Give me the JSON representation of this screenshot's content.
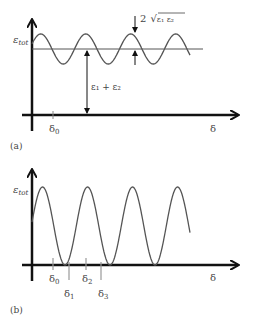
{
  "panels": [
    {
      "id": "a",
      "label": "(a)",
      "y_axis_label": "ε",
      "y_axis_sub": "tot",
      "x_axis_label": "δ",
      "tick_labels": [
        {
          "text": "δ",
          "sub": "0"
        }
      ],
      "annotation_amplitude": {
        "prefix": "2",
        "radicand": "ε₁ ε₂"
      },
      "annotation_mean": "ε₁ + ε₂"
    },
    {
      "id": "b",
      "label": "(b)",
      "y_axis_label": "ε",
      "y_axis_sub": "tot",
      "x_axis_label": "δ",
      "tick_labels": [
        {
          "text": "δ",
          "sub": "0"
        },
        {
          "text": "δ",
          "sub": "1"
        },
        {
          "text": "δ",
          "sub": "2"
        },
        {
          "text": "δ",
          "sub": "3"
        }
      ]
    }
  ]
}
